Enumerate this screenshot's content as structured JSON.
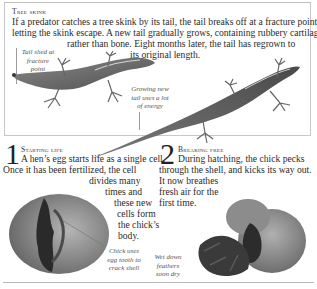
{
  "skink_section": {
    "heading": "Tree skink",
    "lines": [
      "If a predator catches a tree skink by its tail, the tail breaks off at a fracture point,",
      "letting the skink escape. A new tail gradually grows, containing rubbery cartilage",
      "rather than bone. Eight months later, the tail has regrown to",
      "its original length."
    ],
    "captions": {
      "tail_shed": [
        "Tail shed at",
        "fracture",
        "point"
      ],
      "growing_tail": [
        "Growing new",
        "tail uses a lot",
        "of energy"
      ]
    },
    "images": [
      "skink-tailless",
      "skink-regrown-tail"
    ]
  },
  "steps": [
    {
      "number": "1",
      "title": "Starting life",
      "lines": [
        "A hen’s egg starts life as a single cell.",
        "Once it has been fertilized, the cell",
        "divides many",
        "times and",
        "these new",
        "cells form",
        "the chick’s",
        "body."
      ],
      "caption": [
        "Chick uses",
        "egg tooth to",
        "crack shell"
      ],
      "image": "chick-cracking-egg"
    },
    {
      "number": "2",
      "title": "Breaking free",
      "lines": [
        "During hatching, the chick pecks",
        "through the shell, and kicks its way out.",
        "It now breathes",
        "fresh air for the",
        "first time."
      ],
      "caption": [
        "Wet down",
        "feathers",
        "soon dry"
      ],
      "image": "chick-hatched"
    }
  ],
  "colors": {
    "text": "#2b2b2b",
    "frame": "#c8c8c8",
    "rule": "#b9b9b9",
    "egg": "#9a9a9a",
    "lizard": "#6f6f6f"
  }
}
